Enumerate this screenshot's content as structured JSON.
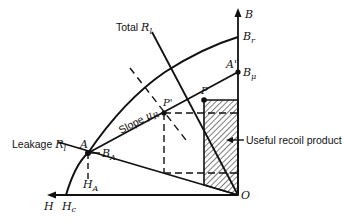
{
  "figure": {
    "colors": {
      "ink": "#111111",
      "background": "#ffffff"
    }
  },
  "axes": {
    "vertical": {
      "label": "B"
    },
    "horizontal": {
      "label": "H"
    },
    "origin": {
      "label": "O"
    }
  },
  "points": {
    "Br": {
      "main": "B",
      "sub": "r"
    },
    "Bmu": {
      "main": "B",
      "sub": "μ"
    },
    "Aprime": {
      "main": "A'"
    },
    "P": {
      "main": "P"
    },
    "Pprime": {
      "main": "P'"
    },
    "A": {
      "main": "A"
    },
    "BA": {
      "prefix": "—",
      "main": "B",
      "sub": "A"
    },
    "HA": {
      "main": "H",
      "sub": "A"
    },
    "Hc": {
      "main": "H",
      "sub": "c"
    }
  },
  "labels": {
    "total_rl": {
      "text": "Total ",
      "var": "R",
      "sub": "l"
    },
    "leakage_rl": {
      "text": "Leakage ",
      "var": "R",
      "sub": "l"
    },
    "slope": {
      "text": "Slope ",
      "var": "μ",
      "sub": "R"
    },
    "useful_recoil": "Useful recoil product"
  }
}
